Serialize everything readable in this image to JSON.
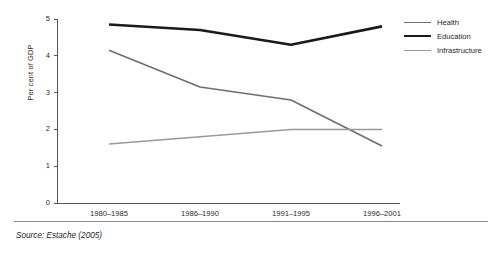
{
  "chart_data": {
    "type": "line",
    "title": "",
    "subtitle": "",
    "xlabel": "",
    "ylabel": "Per cent of GDP",
    "categories": [
      "1980–1985",
      "1986–1990",
      "1991–1995",
      "1996–2001"
    ],
    "ylim": [
      0,
      5
    ],
    "y_ticks": [
      "0",
      "1",
      "2",
      "3",
      "4",
      "5"
    ],
    "grid": false,
    "legend_position": "right",
    "series": [
      {
        "name": "Health",
        "values": [
          4.15,
          3.15,
          2.8,
          1.55
        ],
        "color": "#6e6e6e",
        "width": 1.6
      },
      {
        "name": "Education",
        "values": [
          4.85,
          4.7,
          4.3,
          4.8
        ],
        "color": "#1a1a1a",
        "width": 2.6
      },
      {
        "name": "Infrastructure",
        "values": [
          1.6,
          1.8,
          2.0,
          2.0
        ],
        "color": "#9a9a9a",
        "width": 1.5
      }
    ],
    "annotations": [
      "Source: Estache (2005)"
    ]
  },
  "axes": {
    "y_title": "Per cent of GDP",
    "y_ticks": [
      "5",
      "4",
      "3",
      "2",
      "1",
      "0"
    ],
    "x_ticks": [
      "1980–1985",
      "1986–1990",
      "1991–1995",
      "1996–2001"
    ],
    "axis_color": "#555555"
  },
  "legend": {
    "items": [
      {
        "label": "Health",
        "color": "#6e6e6e",
        "thickness": "1.6px"
      },
      {
        "label": "Education",
        "color": "#1a1a1a",
        "thickness": "2.6px"
      },
      {
        "label": "Infrastructure",
        "color": "#9a9a9a",
        "thickness": "1.5px"
      }
    ]
  },
  "footer": {
    "source": "Source: Estache (2005)"
  }
}
